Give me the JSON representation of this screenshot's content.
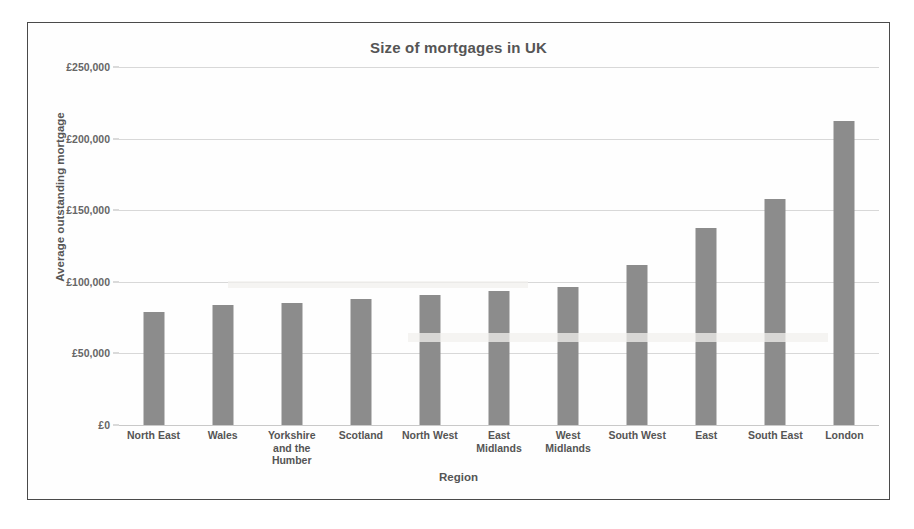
{
  "chart_data": {
    "type": "bar",
    "title": "Size of mortgages in UK",
    "xlabel": "Region",
    "ylabel": "Average outstanding mortgage",
    "categories": [
      "North East",
      "Wales",
      "Yorkshire and the Humber",
      "Scotland",
      "North West",
      "East Midlands",
      "West Midlands",
      "South West",
      "East",
      "South East",
      "London"
    ],
    "category_lines": [
      [
        "North East"
      ],
      [
        "Wales"
      ],
      [
        "Yorkshire",
        "and the",
        "Humber"
      ],
      [
        "Scotland"
      ],
      [
        "North West"
      ],
      [
        "East",
        "Midlands"
      ],
      [
        "West",
        "Midlands"
      ],
      [
        "South West"
      ],
      [
        "East"
      ],
      [
        "South East"
      ],
      [
        "London"
      ]
    ],
    "values": [
      79000,
      83500,
      85500,
      88000,
      90500,
      93500,
      96500,
      111500,
      137500,
      158000,
      212500
    ],
    "ylim": [
      0,
      250000
    ],
    "ytick_values": [
      0,
      50000,
      100000,
      150000,
      200000,
      250000
    ],
    "ytick_labels": [
      "£0",
      "£50,000",
      "£100,000",
      "£150,000",
      "£200,000",
      "£250,000"
    ],
    "grid": true,
    "legend": "none",
    "bar_color": "#8c8c8c",
    "grid_color": "#d8d8d8",
    "text_color": "#555555",
    "frame_color": "#4a4a4a",
    "background": "#ffffff"
  }
}
